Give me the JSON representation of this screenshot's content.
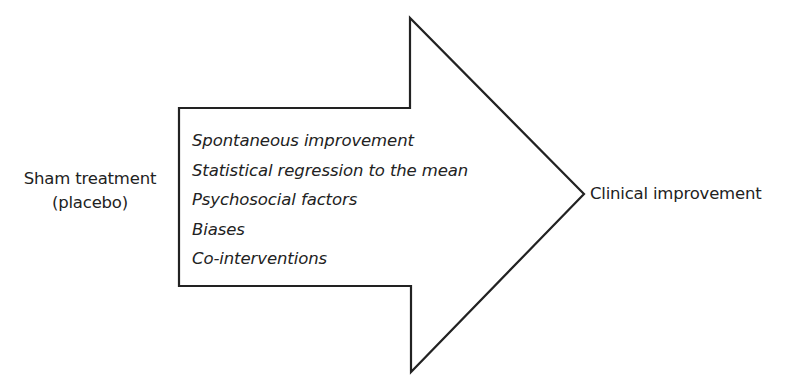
{
  "diagram": {
    "type": "flow-arrow",
    "input": {
      "line1": "Sham treatment",
      "line2": "(placebo)"
    },
    "factors": [
      "Spontaneous improvement",
      "Statistical regression to the mean",
      "Psychosocial factors",
      "Biases",
      "Co-interventions"
    ],
    "output": "Clinical improvement",
    "colors": {
      "stroke": "#222222",
      "text": "#222222",
      "background": "#ffffff"
    }
  }
}
